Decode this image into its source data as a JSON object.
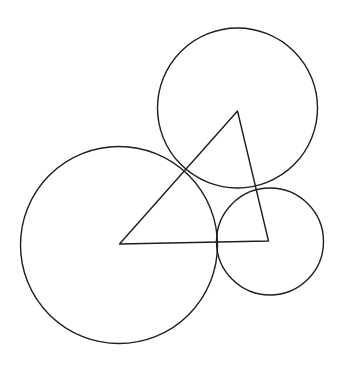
{
  "figure": {
    "width": 342,
    "height": 381,
    "background": "#ffffff",
    "stroke_color": "#1e1e1e",
    "stroke_width": 1.4
  },
  "circles": [
    {
      "id": "large",
      "cx": 119,
      "cy": 245,
      "r": 98.5
    },
    {
      "id": "top",
      "cx": 237.5,
      "cy": 108,
      "r": 80
    },
    {
      "id": "small",
      "cx": 270,
      "cy": 241.5,
      "r": 53.5
    }
  ],
  "triangle": {
    "vertices": [
      {
        "id": "A",
        "x": 119.5,
        "y": 244
      },
      {
        "id": "B",
        "x": 237.5,
        "y": 111
      },
      {
        "id": "C",
        "x": 268.5,
        "y": 241
      }
    ]
  }
}
